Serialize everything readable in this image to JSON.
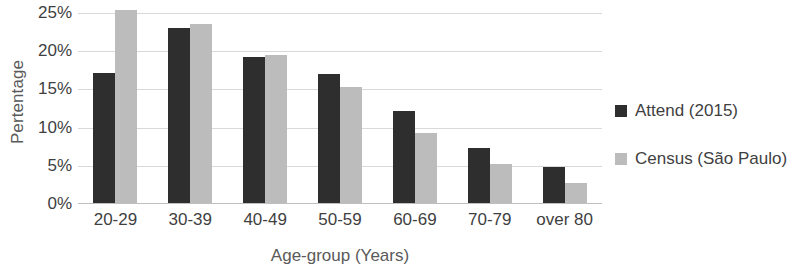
{
  "chart_data": {
    "type": "bar",
    "title": "",
    "xlabel": "Age-group (Years)",
    "ylabel": "Pertentage",
    "categories": [
      "20-29",
      "30-39",
      "40-49",
      "50-59",
      "60-69",
      "70-79",
      "over 80"
    ],
    "series": [
      {
        "name": "Attend (2015)",
        "color": "#2e2e2e",
        "values": [
          17.2,
          23.1,
          19.2,
          17.0,
          12.2,
          7.3,
          4.9
        ]
      },
      {
        "name": "Census (São Paulo)",
        "color": "#bcbcbc",
        "values": [
          25.4,
          23.6,
          19.5,
          15.3,
          9.3,
          5.2,
          2.8
        ]
      }
    ],
    "ylim": [
      0,
      25
    ],
    "y_ticks": [
      0,
      5,
      10,
      15,
      20,
      25
    ],
    "y_tick_labels": [
      "0%",
      "5%",
      "10%",
      "15%",
      "20%",
      "25%"
    ],
    "grid": true,
    "legend_position": "right",
    "value_suffix": "%"
  }
}
